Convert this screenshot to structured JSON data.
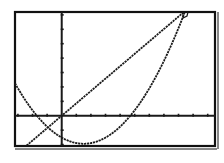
{
  "chart_data": {
    "type": "line",
    "title": "",
    "xlabel": "",
    "ylabel": "",
    "xlim": [
      -3.2,
      10.5
    ],
    "ylim": [
      -2.1,
      7.2
    ],
    "x_tick_step": 1,
    "y_tick_step": 1,
    "grid": false,
    "legend": null,
    "series": [
      {
        "name": "line",
        "kind": "linear",
        "slope": 0.86,
        "intercept": 0,
        "points": [
          [
            -2.4,
            -2.1
          ],
          [
            0,
            0
          ],
          [
            8.3,
            7.1
          ],
          [
            8.4,
            7.2
          ]
        ]
      },
      {
        "name": "parabola",
        "kind": "quadratic",
        "roots": [
          -1.7,
          4.7
        ],
        "a": 0.19,
        "vertex": [
          1.5,
          -1.9
        ],
        "y_intercept": -1.5
      }
    ],
    "intersections": [
      [
        -0.9,
        -0.8
      ],
      [
        8.3,
        7.1
      ]
    ]
  },
  "screen": {
    "frame_color": "#111111",
    "plot_color": "#1a1a1a",
    "background": "#ffffff"
  }
}
